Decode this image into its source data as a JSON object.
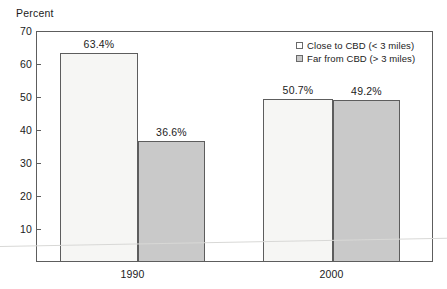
{
  "chart_data": {
    "type": "bar",
    "title": "",
    "subtitle": "",
    "xlabel": "",
    "ylabel": "Percent",
    "categories": [
      "1990",
      "2000"
    ],
    "series": [
      {
        "name": "Close to CBD (< 3 miles)",
        "color": "#f6f6f4",
        "values": [
          63.4,
          49.3
        ],
        "labels": [
          "63.4%",
          "50.7%"
        ]
      },
      {
        "name": "Far from CBD (> 3 miles)",
        "color": "#c9c9c9",
        "values": [
          36.6,
          49.2
        ],
        "labels": [
          "36.6%",
          "49.2%"
        ]
      }
    ],
    "ylim": [
      0,
      70
    ],
    "yticks": [
      10,
      20,
      30,
      40,
      50,
      60,
      70
    ],
    "ytick_labels": [
      "10",
      "20",
      "30",
      "40",
      "50",
      "60",
      "70"
    ],
    "grid": false,
    "legend_position": "top-right",
    "axis_color": "#5d5d5d"
  },
  "legend": {
    "entries": [
      {
        "label": "Close to CBD (< 3 miles)"
      },
      {
        "label": "Far from CBD (> 3 miles)"
      }
    ]
  }
}
